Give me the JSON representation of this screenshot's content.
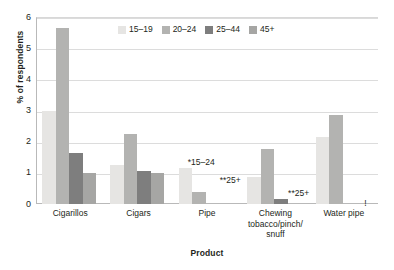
{
  "chart_data": {
    "type": "bar",
    "title": "",
    "xlabel": "Product",
    "ylabel": "% of respondents",
    "ylim": [
      0,
      6
    ],
    "yticks": [
      "0",
      "1",
      "2",
      "3",
      "4",
      "5",
      "6"
    ],
    "grid": true,
    "legend_position": "top-center",
    "categories": [
      "Cigarillos",
      "Cigars",
      "Pipe",
      "Chewing tobacco/pinch/snuff",
      "Water pipe"
    ],
    "category_labels": [
      [
        "Cigarillos"
      ],
      [
        "Cigars"
      ],
      [
        "Pipe"
      ],
      [
        "Chewing",
        "tobacco/pinch/",
        "snuff"
      ],
      [
        "Water pipe"
      ]
    ],
    "series": [
      {
        "name": "15–19",
        "color": "#e6e5e3",
        "values": [
          3.0,
          1.25,
          1.15,
          0.87,
          2.15
        ]
      },
      {
        "name": "20–24",
        "color": "#b3b3b1",
        "values": [
          5.65,
          2.25,
          0.38,
          1.75,
          2.85
        ]
      },
      {
        "name": "25–44",
        "color": "#7e7e7e",
        "values": [
          1.65,
          1.05,
          null,
          0.15,
          null
        ]
      },
      {
        "name": "45+",
        "color": "#a6a6a4",
        "values": [
          1.0,
          1.0,
          null,
          null,
          null
        ]
      }
    ],
    "annotations": [
      {
        "text": "*15–24",
        "category": "Pipe",
        "x_pct": 48.0,
        "y_value": 1.55
      },
      {
        "text": "**25+",
        "category": "Pipe",
        "x_pct": 56.5,
        "y_value": 0.95
      },
      {
        "text": "**25+",
        "category": "Chewing tobacco/pinch/snuff",
        "x_pct": 76.5,
        "y_value": 0.56
      },
      {
        "text": "!",
        "category": "Water pipe",
        "x_pct": 96.0,
        "y_value": 0.22
      }
    ]
  },
  "legend": {
    "items": [
      {
        "label": "15–19",
        "color": "#e6e5e3"
      },
      {
        "label": "20–24",
        "color": "#b3b3b1"
      },
      {
        "label": "25–44",
        "color": "#7e7e7e"
      },
      {
        "label": "45+",
        "color": "#a6a6a4"
      }
    ]
  },
  "axes": {
    "y_title": "% of respondents",
    "x_title": "Product"
  }
}
